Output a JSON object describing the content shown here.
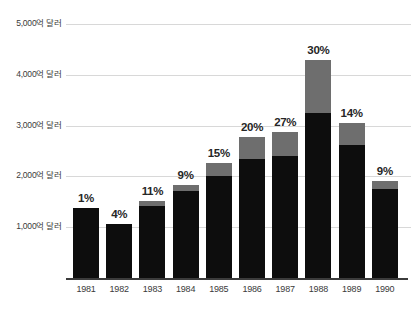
{
  "chart_data": {
    "type": "bar",
    "title": "",
    "subtitle": "",
    "xlabel": "",
    "ylabel": "",
    "stacked": true,
    "grid": true,
    "legend_position": "none",
    "ylim": [
      0,
      5000
    ],
    "yunit": "억 달러",
    "ytick_labels": [
      "5,000억 달러",
      "4,000억 달러",
      "3,000억 달러",
      "2,000억 달러",
      "1,000억 달러"
    ],
    "ytick_values": [
      5000,
      4000,
      3000,
      2000,
      1000
    ],
    "categories": [
      "1981",
      "1982",
      "1983",
      "1984",
      "1985",
      "1986",
      "1987",
      "1988",
      "1989",
      "1990"
    ],
    "series": [
      {
        "name": "base",
        "color": "#0d0d0d",
        "values": [
          1370,
          1070,
          1410,
          1710,
          2010,
          2350,
          2400,
          3250,
          2610,
          1755
        ]
      },
      {
        "name": "top",
        "color": "#6e6e6e",
        "values": [
          0,
          0,
          110,
          130,
          260,
          430,
          470,
          1050,
          450,
          150
        ]
      }
    ],
    "totals": [
      1370,
      1070,
      1520,
      1840,
      2270,
      2780,
      2870,
      4300,
      3060,
      1905
    ],
    "data_labels": [
      "1%",
      "4%",
      "11%",
      "9%",
      "15%",
      "20%",
      "27%",
      "30%",
      "14%",
      "9%"
    ],
    "colors": {
      "bar_base": "#0d0d0d",
      "bar_top": "#6e6e6e",
      "gridline": "#d8d8d8",
      "axis": "#3b3b3b",
      "text": "#3a3a3a",
      "label_text": "#262626",
      "background": "#ffffff"
    }
  }
}
